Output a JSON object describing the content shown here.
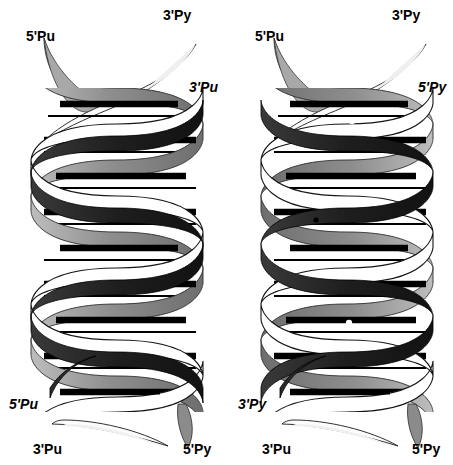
{
  "figure": {
    "background_color": "#ffffff",
    "colors": {
      "white_strand": "#ffffff",
      "white_strand_outline": "#000000",
      "gray_strand_light": "#c8c8c8",
      "gray_strand_mid": "#8a8a8a",
      "gray_strand_dark": "#6b6b6b",
      "dark_strand": "#262626",
      "dark_strand_deep": "#111111",
      "rung": "#000000",
      "dot_white": "#ffffff",
      "dot_black": "#000000",
      "text": "#000000"
    }
  },
  "panels": [
    {
      "id": "left-panel",
      "name": "parallel-triplex",
      "labels": [
        {
          "id": "left-top-5pu",
          "text": "5'Pu",
          "style": "upright",
          "x": 26,
          "y": 28
        },
        {
          "id": "left-top-3py",
          "text": "3'Py",
          "style": "upright",
          "x": 163,
          "y": 7
        },
        {
          "id": "left-top-3pu",
          "text": "3'Pu",
          "style": "italic",
          "x": 189,
          "y": 79
        },
        {
          "id": "left-bot-5pu",
          "text": "5'Pu",
          "style": "italic",
          "x": 9,
          "y": 396
        },
        {
          "id": "left-bot-3pu",
          "text": "3'Pu",
          "style": "upright",
          "x": 33,
          "y": 441
        },
        {
          "id": "left-bot-5py",
          "text": "5'Py",
          "style": "upright",
          "x": 183,
          "y": 441
        }
      ],
      "dots": []
    },
    {
      "id": "right-panel",
      "name": "antiparallel-triplex",
      "labels": [
        {
          "id": "right-top-5pu",
          "text": "5'Pu",
          "style": "upright",
          "x": 255,
          "y": 28
        },
        {
          "id": "right-top-3py",
          "text": "3'Py",
          "style": "upright",
          "x": 392,
          "y": 7
        },
        {
          "id": "right-top-5py",
          "text": "5'Py",
          "style": "italic",
          "x": 418,
          "y": 79
        },
        {
          "id": "right-bot-3py",
          "text": "3'Py",
          "style": "italic",
          "x": 238,
          "y": 396
        },
        {
          "id": "right-bot-3pu",
          "text": "3'Pu",
          "style": "upright",
          "x": 262,
          "y": 441
        },
        {
          "id": "right-bot-5py",
          "text": "5'Py",
          "style": "upright",
          "x": 412,
          "y": 441
        }
      ],
      "dots": [
        {
          "id": "dot-1",
          "x": 352,
          "y": 121,
          "r": 3.2,
          "fill": "#ffffff"
        },
        {
          "id": "dot-2",
          "x": 316,
          "y": 220,
          "r": 2.6,
          "fill": "#000000"
        },
        {
          "id": "dot-3",
          "x": 349,
          "y": 323,
          "r": 3.2,
          "fill": "#ffffff"
        }
      ]
    }
  ],
  "helix_geometry": {
    "body_top": 88,
    "body_bottom": 412,
    "period": 108,
    "left_center_x": 117,
    "right_center_x": 347,
    "radius": 86,
    "ribbon_width": 15,
    "rung_count_per_panel": 18
  }
}
